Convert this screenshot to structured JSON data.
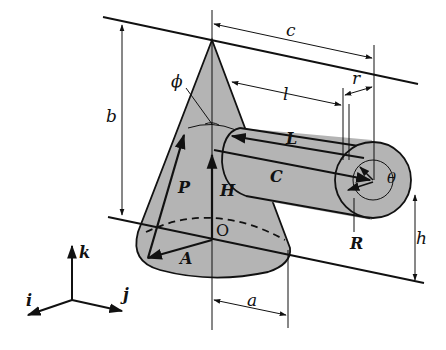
{
  "diagram": {
    "colors": {
      "fill": "#b4b4b4",
      "stroke": "#111111",
      "background": "#ffffff"
    },
    "dimension_labels": {
      "a": "a",
      "b": "b",
      "c": "c",
      "h": "h",
      "l": "l",
      "r": "r"
    },
    "vector_labels": {
      "A": "A",
      "C": "C",
      "H": "H",
      "L": "L",
      "P": "P",
      "R": "R"
    },
    "angle_labels": {
      "phi": "ϕ",
      "theta": "θ"
    },
    "origin_label": "O",
    "axes": {
      "i": "i",
      "j": "j",
      "k": "k"
    }
  }
}
